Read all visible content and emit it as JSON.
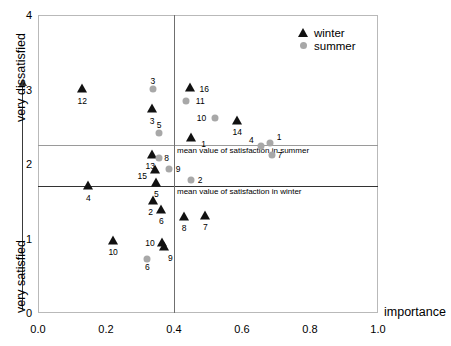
{
  "chart_data": {
    "type": "scatter",
    "title": "",
    "xlabel": "importance",
    "ylabel_top": "very dissatisfied",
    "ylabel_bottom": "very satisfied",
    "xlim": [
      0.0,
      1.0
    ],
    "ylim": [
      0,
      4
    ],
    "xticks": [
      "0.0",
      "0.2",
      "0.4",
      "0.6",
      "0.8",
      "1.0"
    ],
    "xtick_values": [
      0.0,
      0.2,
      0.4,
      0.6,
      0.8,
      1.0
    ],
    "yticks": [
      "0",
      "1",
      "2",
      "3",
      "4"
    ],
    "ytick_values": [
      0,
      1,
      2,
      3,
      4
    ],
    "grid": false,
    "legend_position": "top-right",
    "legend": [
      {
        "name": "winter",
        "marker": "triangle",
        "color": "#111111"
      },
      {
        "name": "summer",
        "marker": "circle",
        "color": "#a8a8a8"
      }
    ],
    "reference_lines": [
      {
        "name": "mean value of satisfaction in summer",
        "orientation": "horizontal",
        "value": 2.25,
        "color": "#9a9a9a",
        "width": 1
      },
      {
        "name": "mean value of satisfaction in winter",
        "orientation": "horizontal",
        "value": 1.7,
        "color": "#333333",
        "width": 1.6
      },
      {
        "name": "mean importance",
        "orientation": "vertical",
        "value": 0.4,
        "color": "#6f6f6f",
        "width": 1
      }
    ],
    "series": [
      {
        "name": "winter",
        "marker": "triangle",
        "color": "#111111",
        "points": [
          {
            "label": "12",
            "x": 0.13,
            "y": 3.01,
            "label_dx": 0,
            "label_dy": 7
          },
          {
            "label": "3",
            "x": 0.336,
            "y": 2.74,
            "label_dx": 0,
            "label_dy": 7
          },
          {
            "label": "16",
            "x": 0.448,
            "y": 3.02,
            "label_dx": 14,
            "label_dy": -4
          },
          {
            "label": "14",
            "x": 0.586,
            "y": 2.58,
            "label_dx": 0,
            "label_dy": 6
          },
          {
            "label": "1",
            "x": 0.449,
            "y": 2.35,
            "label_dx": 13,
            "label_dy": 1
          },
          {
            "label": "13",
            "x": 0.336,
            "y": 2.12,
            "label_dx": -2,
            "label_dy": 6
          },
          {
            "label": "15",
            "x": 0.345,
            "y": 1.92,
            "label_dx": -13,
            "label_dy": 1
          },
          {
            "label": "5",
            "x": 0.348,
            "y": 1.75,
            "label_dx": 0,
            "label_dy": 6
          },
          {
            "label": "4",
            "x": 0.148,
            "y": 1.71,
            "label_dx": 0,
            "label_dy": 7
          },
          {
            "label": "2",
            "x": 0.337,
            "y": 1.5,
            "label_dx": -2,
            "label_dy": 6
          },
          {
            "label": "6",
            "x": 0.363,
            "y": 1.38,
            "label_dx": 0,
            "label_dy": 6
          },
          {
            "label": "8",
            "x": 0.43,
            "y": 1.29,
            "label_dx": 0,
            "label_dy": 6
          },
          {
            "label": "7",
            "x": 0.492,
            "y": 1.3,
            "label_dx": 0,
            "label_dy": 6
          },
          {
            "label": "10",
            "x": 0.221,
            "y": 0.97,
            "label_dx": 0,
            "label_dy": 6
          },
          {
            "label": "10",
            "x": 0.365,
            "y": 0.94,
            "label_dx": -12,
            "label_dy": -5
          },
          {
            "label": "9",
            "x": 0.372,
            "y": 0.88,
            "label_dx": 6,
            "label_dy": 6
          }
        ]
      },
      {
        "name": "summer",
        "marker": "circle",
        "color": "#a8a8a8",
        "points": [
          {
            "label": "3",
            "x": 0.338,
            "y": 3.01,
            "label_dx": 0,
            "label_dy": -13
          },
          {
            "label": "11",
            "x": 0.436,
            "y": 2.85,
            "label_dx": 14,
            "label_dy": -5
          },
          {
            "label": "10",
            "x": 0.522,
            "y": 2.62,
            "label_dx": -14,
            "label_dy": -5
          },
          {
            "label": "5",
            "x": 0.356,
            "y": 2.42,
            "label_dx": 0,
            "label_dy": -13
          },
          {
            "label": "4",
            "x": 0.657,
            "y": 2.24,
            "label_dx": -10,
            "label_dy": -11
          },
          {
            "label": "1",
            "x": 0.683,
            "y": 2.28,
            "label_dx": 9,
            "label_dy": -11
          },
          {
            "label": "7",
            "x": 0.688,
            "y": 2.12,
            "label_dx": 8,
            "label_dy": -5
          },
          {
            "label": "8",
            "x": 0.355,
            "y": 2.08,
            "label_dx": 8,
            "label_dy": -5
          },
          {
            "label": "9",
            "x": 0.386,
            "y": 1.93,
            "label_dx": 9,
            "label_dy": -5
          },
          {
            "label": "2",
            "x": 0.45,
            "y": 1.78,
            "label_dx": 9,
            "label_dy": -5
          },
          {
            "label": "6",
            "x": 0.322,
            "y": 0.72,
            "label_dx": 0,
            "label_dy": 3
          }
        ]
      }
    ]
  }
}
